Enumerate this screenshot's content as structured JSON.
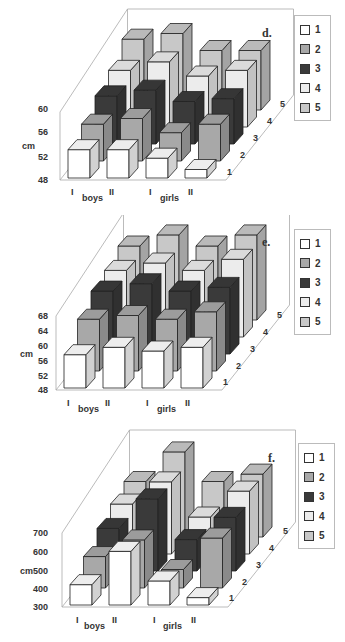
{
  "colors": {
    "series_1": "#ffffff",
    "series_2": "#a8a8a8",
    "series_3": "#3a3a3a",
    "series_4": "#ececec",
    "series_5": "#c8c8c8",
    "outline": "#222222",
    "axis": "#aaaaaa"
  },
  "legend": [
    "1",
    "2",
    "3",
    "4",
    "5"
  ],
  "chart_data": [
    {
      "type": "bar",
      "subtype": "3d-bar",
      "panel_label": "d.",
      "title": "",
      "ylabel": "cm",
      "yticks": [
        "48",
        "52",
        "56",
        "60"
      ],
      "ylim": [
        48,
        60
      ],
      "categories": [
        "boys I",
        "boys II",
        "girls I",
        "girls II"
      ],
      "category_ticks": [
        "I",
        "II",
        "I",
        "II"
      ],
      "group_labels": [
        "boys",
        "girls"
      ],
      "depth_labels": [
        "1",
        "2",
        "3",
        "4",
        "5"
      ],
      "legend_position": "right",
      "series": [
        {
          "name": "1",
          "values": [
            53.0,
            53.0,
            51.5,
            49.5
          ]
        },
        {
          "name": "2",
          "values": [
            54.5,
            55.5,
            53.0,
            54.5
          ]
        },
        {
          "name": "3",
          "values": [
            56.5,
            57.5,
            55.5,
            56.0
          ]
        },
        {
          "name": "4",
          "values": [
            58.0,
            59.5,
            57.0,
            58.0
          ]
        },
        {
          "name": "5",
          "values": [
            60.5,
            61.5,
            58.5,
            58.5
          ]
        }
      ]
    },
    {
      "type": "bar",
      "subtype": "3d-bar",
      "panel_label": "e.",
      "title": "",
      "ylabel": "cm",
      "yticks": [
        "48",
        "52",
        "56",
        "60",
        "64",
        "68"
      ],
      "ylim": [
        48,
        68
      ],
      "categories": [
        "boys I",
        "boys II",
        "girls I",
        "girls II"
      ],
      "category_ticks": [
        "I",
        "II",
        "I",
        "II"
      ],
      "group_labels": [
        "boys",
        "girls"
      ],
      "depth_labels": [
        "1",
        "2",
        "3",
        "4",
        "5"
      ],
      "legend_position": "right",
      "series": [
        {
          "name": "1",
          "values": [
            57,
            59,
            58,
            59
          ]
        },
        {
          "name": "2",
          "values": [
            62,
            63,
            62,
            64
          ]
        },
        {
          "name": "3",
          "values": [
            65,
            67,
            65,
            66
          ]
        },
        {
          "name": "4",
          "values": [
            66,
            68,
            66,
            69
          ]
        },
        {
          "name": "5",
          "values": [
            68,
            71,
            68,
            71
          ]
        }
      ]
    },
    {
      "type": "bar",
      "subtype": "3d-bar",
      "panel_label": "f.",
      "title": "",
      "ylabel": "cm",
      "yticks": [
        "300",
        "400",
        "500",
        "600",
        "700"
      ],
      "ylim": [
        300,
        700
      ],
      "categories": [
        "boys I",
        "boys II",
        "girls I",
        "girls II"
      ],
      "category_ticks": [
        "I",
        "II",
        "I",
        "II"
      ],
      "group_labels": [
        "boys",
        "girls"
      ],
      "depth_labels": [
        "1",
        "2",
        "3",
        "4",
        "5"
      ],
      "legend_position": "right",
      "series": [
        {
          "name": "1",
          "values": [
            410,
            590,
            430,
            340
          ]
        },
        {
          "name": "2",
          "values": [
            470,
            560,
            400,
            570
          ]
        },
        {
          "name": "3",
          "values": [
            530,
            690,
            470,
            590
          ]
        },
        {
          "name": "4",
          "values": [
            570,
            690,
            500,
            640
          ]
        },
        {
          "name": "5",
          "values": [
            600,
            760,
            600,
            640
          ]
        }
      ]
    }
  ]
}
